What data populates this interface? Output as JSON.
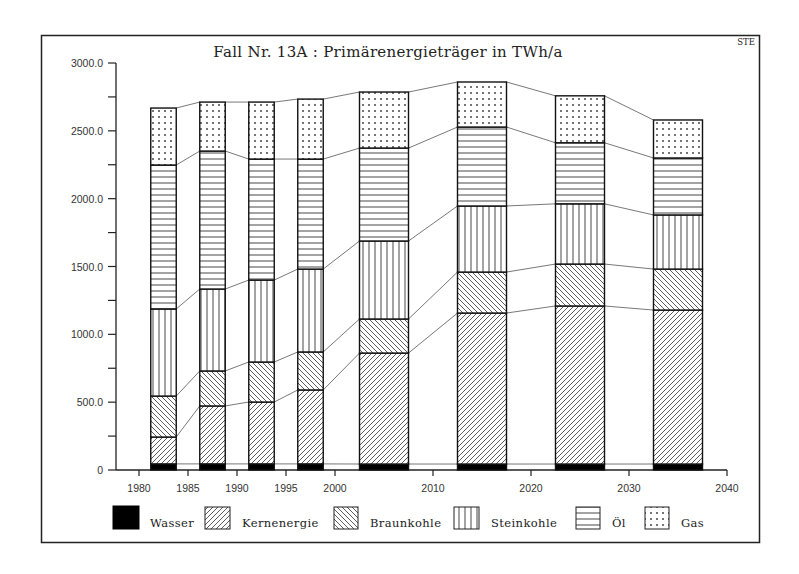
{
  "chart_data": {
    "type": "bar",
    "stacked": true,
    "title": "Fall Nr. 13A :  Primärenergieträger in TWh/a",
    "corner_label": "STE",
    "xlabel": "",
    "ylabel": "TWh/a",
    "x": [
      1982.5,
      1987.5,
      1992.5,
      1997.5,
      2005,
      2015,
      2025,
      2035
    ],
    "bar_widths_years": [
      2.6,
      2.6,
      2.6,
      2.6,
      5,
      5,
      5,
      5
    ],
    "xlim": [
      1978,
      2040
    ],
    "x_ticks": [
      1980,
      1985,
      1990,
      1995,
      2000,
      2010,
      2020,
      2030,
      2040
    ],
    "x_tick_labels": [
      "1980",
      "1985",
      "1990",
      "1995",
      "2000",
      "2010",
      "2020",
      "2030",
      "2040"
    ],
    "ylim": [
      0,
      3000
    ],
    "y_ticks_major": [
      0,
      500,
      1000,
      1500,
      2000,
      2500,
      3000
    ],
    "y_tick_labels": [
      "0",
      "500.0",
      "1000.0",
      "1500.0",
      "2000.0",
      "2500.0",
      "3000.0"
    ],
    "y_ticks_minor_step": 250,
    "grid": false,
    "connector_lines": true,
    "legend_position": "bottom",
    "series": [
      {
        "name": "Wasser",
        "pattern": "solid-black",
        "values": [
          45,
          45,
          45,
          45,
          44,
          44,
          44,
          44
        ]
      },
      {
        "name": "Kernenergie",
        "pattern": "diagonal-up",
        "values": [
          198,
          427,
          456,
          545,
          818,
          1113,
          1165,
          1135
        ]
      },
      {
        "name": "Braunkohle",
        "pattern": "diagonal-down",
        "values": [
          302,
          258,
          295,
          280,
          251,
          302,
          309,
          302
        ]
      },
      {
        "name": "Steinkohle",
        "pattern": "vertical-lines",
        "values": [
          642,
          604,
          604,
          611,
          575,
          487,
          444,
          399
        ]
      },
      {
        "name": "Öl",
        "pattern": "horizontal-lines",
        "values": [
          1061,
          1017,
          892,
          811,
          685,
          582,
          450,
          420
        ]
      },
      {
        "name": "Gas",
        "pattern": "dots",
        "values": [
          420,
          361,
          420,
          442,
          413,
          332,
          346,
          280
        ]
      }
    ],
    "totals": [
      2668,
      2712,
      2712,
      2734,
      2786,
      2860,
      2758,
      2580
    ]
  },
  "legend": {
    "items": [
      {
        "label": "Wasser"
      },
      {
        "label": "Kernenergie"
      },
      {
        "label": "Braunkohle"
      },
      {
        "label": "Steinkohle"
      },
      {
        "label": "Öl"
      },
      {
        "label": "Gas"
      }
    ]
  },
  "colors": {
    "ink": "#1a1a1a",
    "paper": "#ffffff",
    "connector": "#555555"
  }
}
